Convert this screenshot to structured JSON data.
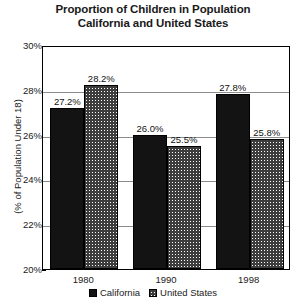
{
  "chart_data": {
    "type": "bar",
    "title": "Proportion of Children in Population California and United States",
    "title_lines": [
      "Proportion of Children in Population",
      "California and United States"
    ],
    "xlabel": "",
    "ylabel": "(% of Population Under 18)",
    "categories": [
      "1980",
      "1990",
      "1998"
    ],
    "series": [
      {
        "name": "California",
        "values": [
          27.2,
          26.0,
          27.8
        ],
        "labels": [
          "27.2%",
          "26.0%",
          "27.8%"
        ],
        "color": "#131313",
        "pattern": "solid"
      },
      {
        "name": "United States",
        "values": [
          28.2,
          25.5,
          25.8
        ],
        "labels": [
          "28.2%",
          "25.5%",
          "25.8%"
        ],
        "color": "#3d3d3d",
        "pattern": "checkered"
      }
    ],
    "ylim": [
      20,
      30
    ],
    "ytick_step": 2,
    "ytick_labels": [
      "30%",
      "28%",
      "26%",
      "24%",
      "22%",
      "20%"
    ],
    "ytick_values": [
      30,
      28,
      26,
      24,
      22,
      20
    ],
    "grid": true,
    "legend_position": "bottom",
    "legend_entries": [
      "California",
      "United States"
    ]
  }
}
